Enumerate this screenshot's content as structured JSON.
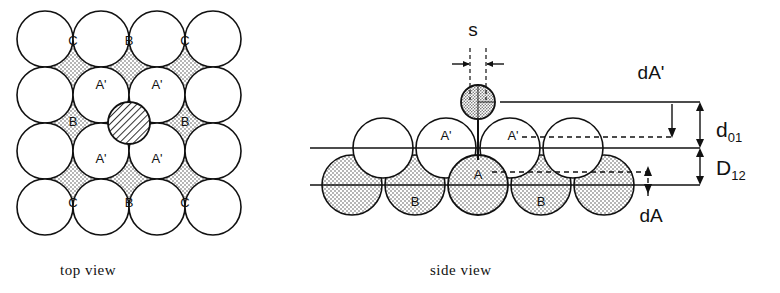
{
  "figure": {
    "colors": {
      "line": "#111111",
      "stipple_fill": "#cccccc",
      "hatch_fill": "#9a9a9a",
      "background": "#ffffff"
    },
    "panels": [
      {
        "id": "top-view",
        "caption": "top view"
      },
      {
        "id": "side-view",
        "caption": "side view"
      }
    ]
  },
  "top_view": {
    "caption": "top view",
    "description": "4x4 grid of solid outline circles (first layer) overlaid with a 3x3 grid of dashed stippled circles (second layer), plus one central cross-hatched adsorbate circle.",
    "geometry": {
      "solid_rows": 4,
      "solid_cols": 4,
      "solid_radius": 28,
      "cell": 56,
      "origin_x": 45,
      "origin_y": 39,
      "dashed_rows": 3,
      "dashed_cols": 3,
      "dashed_radius": 28,
      "adsorbate_radius": 21,
      "adsorbate_x": 129,
      "adsorbate_y": 123
    },
    "site_labels": [
      {
        "text": "C",
        "x": 73,
        "y": 42
      },
      {
        "text": "B",
        "x": 129,
        "y": 42
      },
      {
        "text": "C",
        "x": 185,
        "y": 42
      },
      {
        "text": "A'",
        "x": 101,
        "y": 86
      },
      {
        "text": "A'",
        "x": 157,
        "y": 86
      },
      {
        "text": "B",
        "x": 73,
        "y": 123
      },
      {
        "text": "B",
        "x": 185,
        "y": 123
      },
      {
        "text": "A'",
        "x": 101,
        "y": 160
      },
      {
        "text": "A'",
        "x": 157,
        "y": 160
      },
      {
        "text": "C",
        "x": 73,
        "y": 204
      },
      {
        "text": "B",
        "x": 129,
        "y": 204
      },
      {
        "text": "C",
        "x": 185,
        "y": 204
      }
    ]
  },
  "side_view": {
    "caption": "side view",
    "description": "Two atomic layers seen edge-on: open A'/top-layer circles and stippled B/second-layer circles, with a small stippled adsorbate atom S on top.",
    "geometry": {
      "atom_radius": 30,
      "row_front_y": 185,
      "row_back_y": 148,
      "adsorbate_radius": 17,
      "adsorbate_x": 478,
      "adsorbate_y": 102
    },
    "atom_labels": [
      {
        "text": "A'",
        "x": 446,
        "y": 137
      },
      {
        "text": "A'",
        "x": 513,
        "y": 137
      },
      {
        "text": "A",
        "x": 478,
        "y": 176
      },
      {
        "text": "B",
        "x": 415,
        "y": 203
      },
      {
        "text": "B",
        "x": 541,
        "y": 203
      }
    ],
    "annotations": [
      {
        "name": "adsorbate-label",
        "text": "s",
        "x": 473,
        "y": 30
      },
      {
        "name": "dA-prime-label",
        "text": "dA'",
        "x": 651,
        "y": 72
      },
      {
        "name": "d01-label",
        "text": "d",
        "sub": "01",
        "x": 722,
        "y": 130
      },
      {
        "name": "D12-label",
        "text": "D",
        "sub": "12",
        "x": 722,
        "y": 168
      },
      {
        "name": "dA-label",
        "text": "dA",
        "x": 651,
        "y": 215
      }
    ],
    "reference_lines": {
      "top_surface_y": 102,
      "first_layer_center_y": 148,
      "second_layer_top_y": 148,
      "second_layer_center_y": 185,
      "line_left_x": 310,
      "line_right_x": 700
    },
    "dimension_values": {
      "dA_prime": "dA'",
      "d01": "d01",
      "D12": "D12",
      "dA": "dA",
      "s": "s"
    }
  }
}
